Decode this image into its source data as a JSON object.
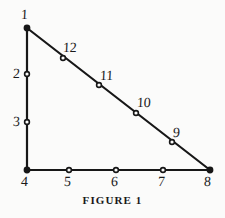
{
  "figure": {
    "caption": "FIGURE 1",
    "stroke_color": "#171717",
    "background_color": "#fbfbfa",
    "marker_fill": "#fbfbfa",
    "width": 225,
    "height": 218
  },
  "chart_data": {
    "type": "diagram",
    "title": "FIGURE 1",
    "shape": "right triangle with 12 labelled nodes",
    "xlabel": "",
    "ylabel": "",
    "grid": false,
    "legend": null,
    "edges": [
      {
        "from": "1",
        "to": "4",
        "name": "left-vertical-side"
      },
      {
        "from": "4",
        "to": "8",
        "name": "bottom-horizontal-side"
      },
      {
        "from": "1",
        "to": "8",
        "name": "hypotenuse"
      }
    ],
    "nodes": [
      {
        "label": "1",
        "x": 27,
        "y": 28,
        "label_x": 21,
        "label_y": 8,
        "side": "left-vertical",
        "vertex": true
      },
      {
        "label": "2",
        "x": 27,
        "y": 74,
        "label_x": 13,
        "label_y": 67,
        "side": "left-vertical",
        "vertex": false
      },
      {
        "label": "3",
        "x": 27,
        "y": 122,
        "label_x": 13,
        "label_y": 115,
        "side": "left-vertical",
        "vertex": false
      },
      {
        "label": "4",
        "x": 27,
        "y": 170,
        "label_x": 21,
        "label_y": 175,
        "side": "corner",
        "vertex": true
      },
      {
        "label": "5",
        "x": 69,
        "y": 170,
        "label_x": 64,
        "label_y": 175,
        "side": "bottom",
        "vertex": false
      },
      {
        "label": "6",
        "x": 116,
        "y": 170,
        "label_x": 111,
        "label_y": 175,
        "side": "bottom",
        "vertex": false
      },
      {
        "label": "7",
        "x": 163,
        "y": 170,
        "label_x": 158,
        "label_y": 175,
        "side": "bottom",
        "vertex": false
      },
      {
        "label": "8",
        "x": 210,
        "y": 170,
        "label_x": 204,
        "label_y": 175,
        "side": "corner",
        "vertex": true
      },
      {
        "label": "9",
        "x": 172,
        "y": 142,
        "label_x": 173,
        "label_y": 126,
        "side": "hypotenuse",
        "vertex": false
      },
      {
        "label": "10",
        "x": 136,
        "y": 113,
        "label_x": 137,
        "label_y": 96,
        "side": "hypotenuse",
        "vertex": false
      },
      {
        "label": "11",
        "x": 99,
        "y": 85,
        "label_x": 100,
        "label_y": 69,
        "side": "hypotenuse",
        "vertex": false
      },
      {
        "label": "12",
        "x": 63,
        "y": 58,
        "label_x": 63,
        "label_y": 41,
        "side": "hypotenuse",
        "vertex": false
      }
    ]
  }
}
